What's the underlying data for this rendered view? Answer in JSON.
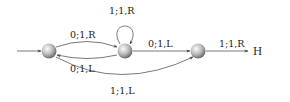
{
  "diagram": {
    "type": "state-machine",
    "nodes": [
      {
        "id": "A",
        "label": "",
        "x": 49,
        "y": 51,
        "initial": true
      },
      {
        "id": "B",
        "label": "",
        "x": 125,
        "y": 51
      },
      {
        "id": "C",
        "label": "",
        "x": 198,
        "y": 51
      },
      {
        "id": "H",
        "label": "H",
        "x": 258,
        "y": 51,
        "halt": true
      }
    ],
    "edges": [
      {
        "from": "A",
        "to": "B",
        "label": "0;1,R"
      },
      {
        "from": "B",
        "to": "A",
        "label": "0;1,L"
      },
      {
        "from": "B",
        "to": "B",
        "label": "1;1,R"
      },
      {
        "from": "B",
        "to": "C",
        "label": "0;1,L"
      },
      {
        "from": "C",
        "to": "H",
        "label": "1;1,R"
      },
      {
        "from": "A",
        "to": "C",
        "label": "1;1,L"
      }
    ],
    "labels": {
      "a_to_b": "0;1,R",
      "b_to_a": "0;1,L",
      "b_loop": "1;1,R",
      "b_to_c": "0;1,L",
      "c_to_h": "1;1,R",
      "a_to_c": "1;1,L",
      "halt": "H"
    },
    "colors": {
      "edge": "#555555",
      "node_light": "#f4f4f4",
      "node_dark": "#6a6a6a",
      "text": "#222222"
    }
  }
}
